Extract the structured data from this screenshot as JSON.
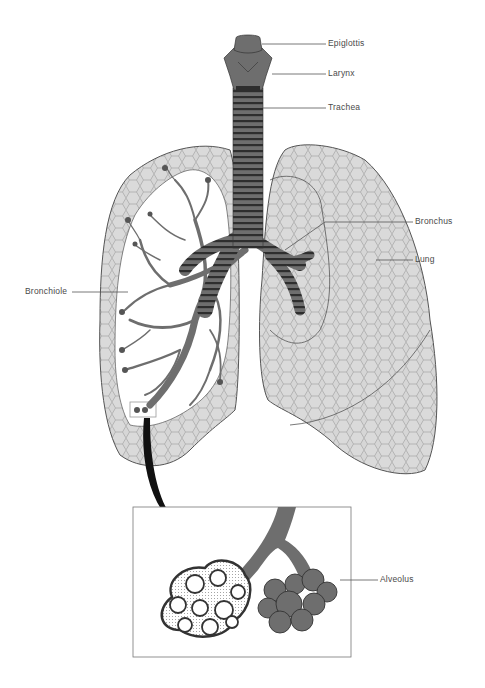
{
  "labels": {
    "epiglottis": "Epiglottis",
    "larynx": "Larynx",
    "trachea": "Trachea",
    "bronchus": "Bronchus",
    "lung": "Lung",
    "bronchiole": "Bronchiole",
    "alveolus": "Alveolus"
  },
  "colors": {
    "airway": "#6e6e6e",
    "airway_dark": "#2e2e2e",
    "lung_fill": "#d4d4d4",
    "lung_cell_line": "#8a8a8a",
    "outline": "#555555",
    "arrow": "#111111",
    "inset_border": "#777777",
    "background": "#ffffff"
  }
}
